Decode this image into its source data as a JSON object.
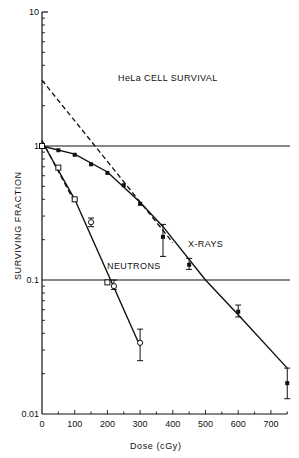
{
  "chart_data": {
    "type": "scatter",
    "title": "HeLa CELL SURVIVAL",
    "xlabel": "Dose (cGy)",
    "ylabel": "SURVIVING FRACTION",
    "xlim": [
      0,
      750
    ],
    "ylim": [
      0.01,
      10
    ],
    "yscale": "log",
    "grid": false,
    "x_ticks": [
      0,
      100,
      200,
      300,
      400,
      500,
      600,
      700
    ],
    "x_tick_labels": [
      "0",
      "100",
      "200",
      "300",
      "400",
      "500",
      "600",
      "700"
    ],
    "y_ticks": [
      0.01,
      0.1,
      1,
      10
    ],
    "y_tick_labels": [
      "0.01",
      "0.1",
      "1",
      "10"
    ],
    "reference_lines": [
      {
        "y": 1,
        "style": "solid"
      },
      {
        "y": 0.1,
        "style": "solid"
      }
    ],
    "annotations": [
      {
        "text": "HeLa CELL SURVIVAL",
        "x": 250,
        "y": 3.0
      },
      {
        "text": "X-RAYS",
        "x": 400,
        "y": 0.2
      },
      {
        "text": "NEUTRONS",
        "x": 120,
        "y": 0.115
      }
    ],
    "series": [
      {
        "name": "X-RAYS",
        "marker": "filled",
        "points": [
          {
            "x": 0,
            "y": 1.0
          },
          {
            "x": 50,
            "y": 0.93
          },
          {
            "x": 100,
            "y": 0.86
          },
          {
            "x": 150,
            "y": 0.73
          },
          {
            "x": 200,
            "y": 0.63
          },
          {
            "x": 250,
            "y": 0.51
          },
          {
            "x": 300,
            "y": 0.37
          },
          {
            "x": 370,
            "y": 0.21,
            "err_lo": 0.15,
            "err_hi": 0.26
          },
          {
            "x": 450,
            "y": 0.13,
            "err_lo": 0.12,
            "err_hi": 0.145
          },
          {
            "x": 600,
            "y": 0.058,
            "err_lo": 0.053,
            "err_hi": 0.065
          },
          {
            "x": 750,
            "y": 0.017,
            "err_lo": 0.013,
            "err_hi": 0.022
          }
        ],
        "fit_curve": [
          [
            0,
            1.0
          ],
          [
            100,
            0.87
          ],
          [
            200,
            0.64
          ],
          [
            300,
            0.38
          ],
          [
            370,
            0.25
          ],
          [
            500,
            0.1
          ],
          [
            600,
            0.055
          ],
          [
            750,
            0.022
          ]
        ],
        "fit_style": "solid"
      },
      {
        "name": "X-RAYS extrapolation",
        "fit_curve": [
          [
            0,
            3.1
          ],
          [
            400,
            0.19
          ]
        ],
        "fit_style": "dashed"
      },
      {
        "name": "NEUTRONS",
        "marker": "open",
        "points": [
          {
            "x": 0,
            "y": 1.0,
            "marker": "square"
          },
          {
            "x": 50,
            "y": 0.69,
            "marker": "square"
          },
          {
            "x": 100,
            "y": 0.4,
            "marker": "square"
          },
          {
            "x": 150,
            "y": 0.27,
            "marker": "circle",
            "err_lo": 0.25,
            "err_hi": 0.29
          },
          {
            "x": 200,
            "y": 0.096,
            "marker": "square"
          },
          {
            "x": 220,
            "y": 0.09,
            "marker": "circle",
            "err_lo": 0.085,
            "err_hi": 0.1
          },
          {
            "x": 300,
            "y": 0.034,
            "marker": "circle",
            "err_lo": 0.025,
            "err_hi": 0.043
          }
        ],
        "fit_curve": [
          [
            0,
            1.08
          ],
          [
            100,
            0.4
          ],
          [
            300,
            0.032
          ]
        ],
        "fit_style": "solid"
      },
      {
        "name": "NEUTRONS initial",
        "fit_curve": [
          [
            0,
            1.1
          ],
          [
            100,
            0.38
          ]
        ],
        "fit_style": "dashed"
      }
    ]
  }
}
